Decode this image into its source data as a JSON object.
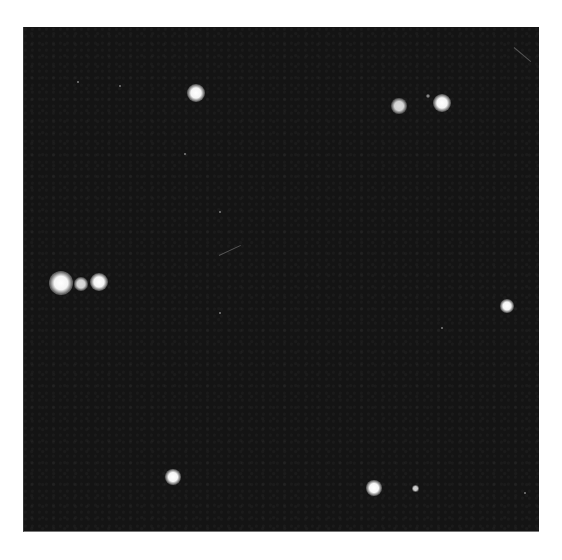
{
  "image": {
    "description": "Dark photographic plate with scattered bright diffraction spots on a white border",
    "background_color": "#141414",
    "border_color": "#ffffff",
    "spot_color": "#ffffff",
    "spots": [
      {
        "id": "top-left-spot",
        "x": 195,
        "y": 93,
        "size": 18
      },
      {
        "id": "top-right-pair-a",
        "x": 398,
        "y": 106,
        "size": 16
      },
      {
        "id": "top-right-pair-b",
        "x": 441,
        "y": 103,
        "size": 18
      },
      {
        "id": "left-cluster-a",
        "x": 60,
        "y": 283,
        "size": 24
      },
      {
        "id": "left-cluster-b",
        "x": 80,
        "y": 284,
        "size": 14
      },
      {
        "id": "left-cluster-c",
        "x": 98,
        "y": 282,
        "size": 18
      },
      {
        "id": "right-spot",
        "x": 506,
        "y": 306,
        "size": 14
      },
      {
        "id": "bottom-left-spot",
        "x": 172,
        "y": 477,
        "size": 16
      },
      {
        "id": "bottom-right-spot",
        "x": 373,
        "y": 488,
        "size": 16
      },
      {
        "id": "bottom-right-faint",
        "x": 414,
        "y": 488,
        "size": 7
      }
    ]
  }
}
